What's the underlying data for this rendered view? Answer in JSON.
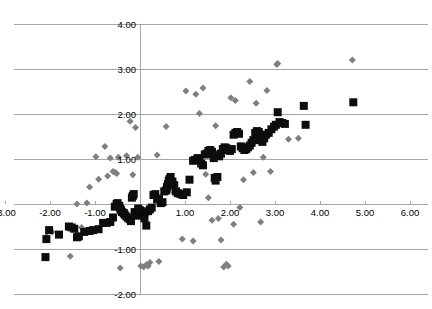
{
  "chart_data": {
    "type": "scatter",
    "title": "",
    "xlabel": "",
    "ylabel": "",
    "xlim": [
      -3.4,
      6.3
    ],
    "ylim": [
      -2.2,
      4.25
    ],
    "grid": true,
    "legend": "none",
    "x_ticks": [
      -3.0,
      -2.0,
      -1.0,
      0.0,
      1.0,
      2.0,
      3.0,
      4.0,
      5.0,
      6.0
    ],
    "x_tick_labels": [
      "-3.00",
      "-2.00",
      "-1.00",
      "0.00",
      "1.00",
      "2.00",
      "3.00",
      "4.00",
      "5.00",
      "6.00"
    ],
    "y_ticks": [
      -2.0,
      -1.0,
      0.0,
      1.0,
      2.0,
      3.0,
      4.0
    ],
    "y_tick_labels": [
      "-2.00",
      "-1.00",
      "0.00",
      "1.00",
      "2.00",
      "3.00",
      "4.00"
    ],
    "marker_colors": {
      "series_diamond": "#7f7f7f",
      "series_square": "#0d0d0d",
      "gridline": "#a6a6a6",
      "background": "#ffffff"
    },
    "series": [
      {
        "name": "series-diamond",
        "marker": "diamond",
        "color": "#7f7f7f",
        "size": 7,
        "points": [
          [
            -2.08,
            -0.72
          ],
          [
            -2.02,
            -0.58
          ],
          [
            -1.95,
            -0.62
          ],
          [
            -1.58,
            -0.5
          ],
          [
            -1.55,
            -1.16
          ],
          [
            -1.4,
            0.0
          ],
          [
            -1.3,
            -0.52
          ],
          [
            -1.18,
            0.02
          ],
          [
            -1.12,
            0.38
          ],
          [
            -0.98,
            1.05
          ],
          [
            -0.92,
            0.55
          ],
          [
            -0.78,
            1.28
          ],
          [
            -0.72,
            0.62
          ],
          [
            -0.66,
            1.02
          ],
          [
            -0.6,
            0.72
          ],
          [
            -0.55,
            0.7
          ],
          [
            -0.52,
            0.68
          ],
          [
            -0.48,
            1.04
          ],
          [
            -0.44,
            -1.42
          ],
          [
            -0.3,
            1.07
          ],
          [
            -0.22,
            1.84
          ],
          [
            -0.16,
            0.65
          ],
          [
            -0.1,
            1.7
          ],
          [
            -0.05,
            1.04
          ],
          [
            0.02,
            -1.38
          ],
          [
            0.08,
            -1.4
          ],
          [
            0.14,
            -1.35
          ],
          [
            0.18,
            -1.38
          ],
          [
            0.22,
            -1.3
          ],
          [
            0.38,
            1.09
          ],
          [
            0.42,
            -1.28
          ],
          [
            0.52,
            0.33
          ],
          [
            0.58,
            1.72
          ],
          [
            0.66,
            0.42
          ],
          [
            0.72,
            0.27
          ],
          [
            0.86,
            0.3
          ],
          [
            0.94,
            -0.78
          ],
          [
            1.02,
            2.51
          ],
          [
            1.06,
            0.26
          ],
          [
            1.18,
            -0.82
          ],
          [
            1.24,
            2.44
          ],
          [
            1.32,
            2.01
          ],
          [
            1.4,
            2.58
          ],
          [
            1.46,
            0.66
          ],
          [
            1.52,
            0.14
          ],
          [
            1.6,
            -0.36
          ],
          [
            1.68,
            1.74
          ],
          [
            1.74,
            -0.32
          ],
          [
            1.8,
            -0.8
          ],
          [
            1.86,
            -1.4
          ],
          [
            1.92,
            -1.34
          ],
          [
            1.96,
            -1.38
          ],
          [
            2.02,
            2.36
          ],
          [
            2.08,
            -0.45
          ],
          [
            2.12,
            2.3
          ],
          [
            2.22,
            -0.08
          ],
          [
            2.3,
            0.54
          ],
          [
            2.44,
            2.72
          ],
          [
            2.52,
            0.7
          ],
          [
            2.58,
            2.24
          ],
          [
            2.68,
            -0.4
          ],
          [
            2.74,
            1.04
          ],
          [
            2.82,
            2.52
          ],
          [
            2.9,
            0.72
          ],
          [
            3.04,
            3.1
          ],
          [
            3.06,
            3.12
          ],
          [
            3.3,
            1.44
          ],
          [
            3.52,
            1.46
          ],
          [
            4.72,
            3.2
          ]
        ]
      },
      {
        "name": "series-square",
        "marker": "square",
        "color": "#0d0d0d",
        "size": 8,
        "points": [
          [
            -2.1,
            -1.18
          ],
          [
            -2.08,
            -0.78
          ],
          [
            -2.02,
            -0.58
          ],
          [
            -1.8,
            -0.68
          ],
          [
            -1.58,
            -0.5
          ],
          [
            -1.52,
            -0.52
          ],
          [
            -1.46,
            -0.55
          ],
          [
            -1.4,
            -0.74
          ],
          [
            -1.36,
            -0.72
          ],
          [
            -1.24,
            -0.62
          ],
          [
            -1.12,
            -0.6
          ],
          [
            -1.04,
            -0.58
          ],
          [
            -0.92,
            -0.56
          ],
          [
            -0.82,
            -0.42
          ],
          [
            -0.74,
            -0.42
          ],
          [
            -0.66,
            -0.4
          ],
          [
            -0.6,
            -0.3
          ],
          [
            -0.56,
            -0.06
          ],
          [
            -0.52,
            0.0
          ],
          [
            -0.5,
            0.02
          ],
          [
            -0.46,
            -0.04
          ],
          [
            -0.44,
            -0.1
          ],
          [
            -0.42,
            -0.14
          ],
          [
            -0.4,
            -0.18
          ],
          [
            -0.36,
            -0.2
          ],
          [
            -0.34,
            -0.24
          ],
          [
            -0.3,
            -0.28
          ],
          [
            -0.26,
            -0.32
          ],
          [
            -0.22,
            -0.34
          ],
          [
            -0.2,
            -0.38
          ],
          [
            -0.18,
            0.14
          ],
          [
            -0.16,
            0.18
          ],
          [
            -0.14,
            0.22
          ],
          [
            -0.12,
            -0.18
          ],
          [
            -0.1,
            -0.22
          ],
          [
            -0.06,
            -0.26
          ],
          [
            -0.04,
            -0.1
          ],
          [
            0.0,
            -0.14
          ],
          [
            0.02,
            -0.2
          ],
          [
            0.06,
            -0.24
          ],
          [
            0.1,
            -0.32
          ],
          [
            0.14,
            -0.48
          ],
          [
            0.18,
            -0.16
          ],
          [
            0.22,
            -0.12
          ],
          [
            0.26,
            -0.08
          ],
          [
            0.3,
            0.2
          ],
          [
            0.34,
            0.22
          ],
          [
            0.38,
            0.1
          ],
          [
            0.42,
            0.12
          ],
          [
            0.46,
            0.02
          ],
          [
            0.5,
            0.04
          ],
          [
            0.54,
            0.28
          ],
          [
            0.58,
            0.3
          ],
          [
            0.6,
            0.38
          ],
          [
            0.62,
            0.44
          ],
          [
            0.64,
            0.52
          ],
          [
            0.66,
            0.56
          ],
          [
            0.68,
            0.6
          ],
          [
            0.72,
            0.5
          ],
          [
            0.76,
            0.42
          ],
          [
            0.8,
            0.28
          ],
          [
            0.84,
            0.24
          ],
          [
            0.9,
            0.22
          ],
          [
            0.96,
            0.2
          ],
          [
            1.04,
            0.26
          ],
          [
            1.1,
            0.54
          ],
          [
            1.18,
            0.96
          ],
          [
            1.22,
            0.98
          ],
          [
            1.28,
            1.02
          ],
          [
            1.32,
            0.98
          ],
          [
            1.36,
            0.9
          ],
          [
            1.4,
            0.86
          ],
          [
            1.44,
            1.1
          ],
          [
            1.48,
            1.12
          ],
          [
            1.52,
            1.18
          ],
          [
            1.56,
            1.2
          ],
          [
            1.6,
            1.16
          ],
          [
            1.62,
            1.1
          ],
          [
            1.64,
            1.02
          ],
          [
            1.66,
            0.58
          ],
          [
            1.68,
            0.52
          ],
          [
            1.72,
            0.6
          ],
          [
            1.76,
            1.06
          ],
          [
            1.8,
            1.12
          ],
          [
            1.84,
            1.22
          ],
          [
            1.88,
            1.26
          ],
          [
            1.92,
            1.24
          ],
          [
            1.96,
            1.2
          ],
          [
            2.0,
            1.18
          ],
          [
            2.04,
            1.22
          ],
          [
            2.08,
            1.54
          ],
          [
            2.12,
            1.58
          ],
          [
            2.16,
            1.6
          ],
          [
            2.2,
            1.56
          ],
          [
            2.24,
            1.28
          ],
          [
            2.28,
            1.24
          ],
          [
            2.32,
            1.2
          ],
          [
            2.36,
            1.22
          ],
          [
            2.4,
            1.26
          ],
          [
            2.44,
            1.3
          ],
          [
            2.48,
            1.36
          ],
          [
            2.52,
            1.42
          ],
          [
            2.56,
            1.58
          ],
          [
            2.6,
            1.62
          ],
          [
            2.64,
            1.6
          ],
          [
            2.68,
            1.42
          ],
          [
            2.72,
            1.38
          ],
          [
            2.76,
            1.46
          ],
          [
            2.8,
            1.54
          ],
          [
            2.86,
            1.58
          ],
          [
            2.92,
            1.66
          ],
          [
            2.98,
            1.72
          ],
          [
            3.02,
            1.76
          ],
          [
            3.06,
            2.04
          ],
          [
            3.1,
            1.82
          ],
          [
            3.16,
            1.8
          ],
          [
            3.22,
            1.78
          ],
          [
            3.64,
            2.18
          ],
          [
            3.68,
            1.76
          ],
          [
            4.74,
            2.26
          ]
        ]
      }
    ]
  }
}
